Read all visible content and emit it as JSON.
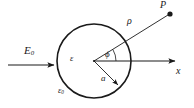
{
  "figure": {
    "kind": "physics-diagram",
    "background_color": "#ffffff",
    "line_color": "#1a1a1a"
  },
  "labels": {
    "applied_field": "E",
    "applied_field_sub": "0",
    "inner_permittivity": "ε",
    "outer_permittivity": "ε",
    "outer_permittivity_sub": "0",
    "angle": "ϕ",
    "radius": "a",
    "radial_distance": "ρ",
    "field_point": "P",
    "axis": "x"
  },
  "geometry": {
    "circle": {
      "cx": 94,
      "cy": 61,
      "r": 37
    },
    "center_dot": {
      "x": 94,
      "y": 61
    },
    "field_arrow": {
      "x1": 8,
      "y1": 65,
      "x2": 58,
      "y2": 65
    },
    "x_axis_arrow": {
      "x1": 94,
      "y1": 61,
      "x2": 180,
      "y2": 61
    },
    "rho_line": {
      "x1": 94,
      "y1": 61,
      "x2": 170,
      "y2": 14
    },
    "radius_line": {
      "x1": 94,
      "y1": 61,
      "x2": 120,
      "y2": 87
    },
    "field_point_dot": {
      "x": 170,
      "y": 14,
      "r": 2.6
    },
    "angle_arc": {
      "radius": 22,
      "start_deg": 0,
      "end_deg": 31
    },
    "phi_value_deg": 31
  }
}
